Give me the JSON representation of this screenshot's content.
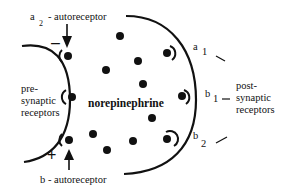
{
  "diagram": {
    "labels": {
      "a2_autoreceptor": {
        "main": "a",
        "sub": "2",
        "suffix": "- autoreceptor"
      },
      "b_autoreceptor": "b - autoreceptor",
      "presynaptic": [
        "pre-",
        "synaptic",
        "receptors"
      ],
      "postsynaptic": [
        "post-",
        "synaptic",
        "receptors"
      ],
      "neurotransmitter": "norepinephrine",
      "a1": {
        "main": "a",
        "sub": "1"
      },
      "b1": {
        "main": "b",
        "sub": "1"
      },
      "b2": {
        "main": "b",
        "sub": "2"
      },
      "minus_sign": "–",
      "plus_sign": "+"
    },
    "colors": {
      "ink": "#111111",
      "background": "#ffffff"
    }
  }
}
